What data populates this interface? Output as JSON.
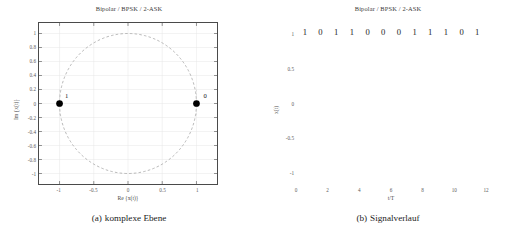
{
  "figure": {
    "subfigures": [
      {
        "id": "a",
        "caption_tag": "(a)",
        "caption_text": "komplexe Ebene"
      },
      {
        "id": "b",
        "caption_tag": "(b)",
        "caption_text": "Signalverlauf"
      }
    ]
  },
  "chart_data": [
    {
      "type": "scatter",
      "title": "Bipolar / BPSK / 2-ASK",
      "xlabel": "Re {x(t)}",
      "ylabel": "Im {x(t)}",
      "xlim": [
        -1.3,
        1.3
      ],
      "ylim": [
        -1.15,
        1.15
      ],
      "grid": true,
      "xticks": [
        -1,
        -0.5,
        0,
        0.5,
        1
      ],
      "xticklabels": [
        "-1",
        "-0.5",
        "0",
        "0.5",
        "1"
      ],
      "yticks": [
        1,
        0.8,
        0.6,
        0.4,
        0.2,
        0,
        -0.2,
        -0.4,
        -0.6,
        -0.8,
        -1
      ],
      "yticklabels": [
        "1",
        "0.8",
        "0.6",
        "0.4",
        "0.2",
        "0",
        "-0.2",
        "-0.4",
        "-0.6",
        "-0.8",
        "-1"
      ],
      "unit_circle": {
        "radius": 1,
        "style": "dashed",
        "color": "#9a9a9a"
      },
      "points": [
        {
          "x": -1,
          "y": 0,
          "label": "1",
          "color": "#000000"
        },
        {
          "x": 1,
          "y": 0,
          "label": "0",
          "color": "#000000"
        }
      ]
    },
    {
      "type": "line",
      "title": "Bipolar / BPSK / 2-ASK",
      "xlabel": "t/T",
      "ylabel": "x(t)",
      "xlim": [
        0,
        12
      ],
      "ylim": [
        -1.18,
        1.18
      ],
      "grid": true,
      "xticks": [
        0,
        2,
        4,
        6,
        8,
        10,
        12
      ],
      "xticklabels": [
        "0",
        "2",
        "4",
        "6",
        "8",
        "10",
        "12"
      ],
      "yticks": [
        1,
        0.5,
        0,
        -0.5,
        -1
      ],
      "yticklabels": [
        "1",
        "0.5",
        "0",
        "-0.5",
        "-1"
      ],
      "bits": [
        "1",
        "0",
        "1",
        "1",
        "0",
        "0",
        "0",
        "1",
        "1",
        "1",
        "0",
        "1"
      ],
      "carrier_cycles_per_symbol": 2.5,
      "line_color": "#333333"
    }
  ]
}
